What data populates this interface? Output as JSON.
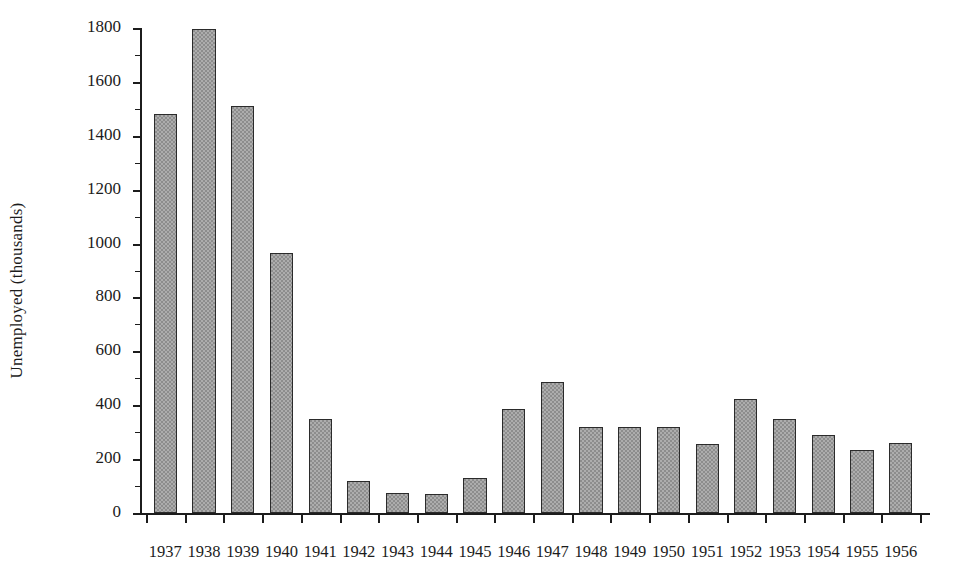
{
  "chart_data": {
    "type": "bar",
    "title": "",
    "xlabel": "",
    "ylabel": "Unemployed (thousands)",
    "categories": [
      "1937",
      "1938",
      "1939",
      "1940",
      "1941",
      "1942",
      "1943",
      "1944",
      "1945",
      "1946",
      "1947",
      "1948",
      "1949",
      "1950",
      "1951",
      "1952",
      "1953",
      "1954",
      "1955",
      "1956"
    ],
    "values": [
      1480,
      1795,
      1510,
      965,
      350,
      120,
      75,
      70,
      130,
      385,
      485,
      320,
      320,
      320,
      255,
      425,
      350,
      290,
      235,
      260
    ],
    "ylim": [
      0,
      1800
    ],
    "ytick_labels": [
      "0",
      "200",
      "400",
      "600",
      "800",
      "1000",
      "1200",
      "1400",
      "1600",
      "1800"
    ],
    "ytick_values": [
      0,
      200,
      400,
      600,
      800,
      1000,
      1200,
      1400,
      1600,
      1800
    ],
    "grid": false,
    "legend": null,
    "bar_color": "#8d8d8d",
    "bar_edge_color": "#2b2b2b",
    "axis_color": "#1c1c1c",
    "background_color": "#ffffff"
  }
}
